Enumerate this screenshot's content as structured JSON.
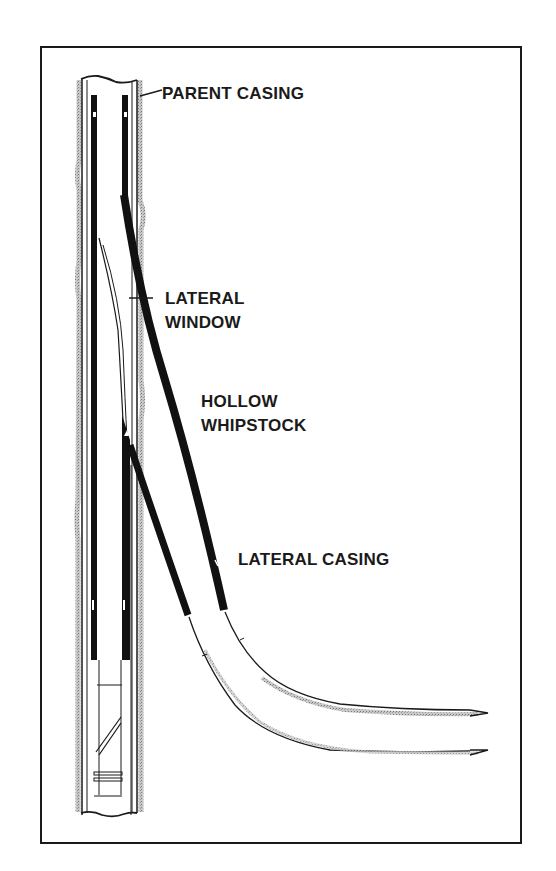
{
  "figure": {
    "type": "well-schematic",
    "description_visible": "Multilateral well diagram with hollow whipstock",
    "colors": {
      "background": "#ffffff",
      "ink": "#1a1a1a",
      "shading": "#9a9a9a"
    }
  },
  "labels": {
    "parent_casing": "PARENT CASING",
    "lateral_window": [
      "LATERAL",
      "WINDOW"
    ],
    "hollow_whipstock": [
      "HOLLOW",
      "WHIPSTOCK"
    ],
    "lateral_casing": "LATERAL CASING"
  },
  "components": [
    {
      "name": "parent-casing",
      "label": "PARENT CASING"
    },
    {
      "name": "lateral-window",
      "label": "LATERAL WINDOW"
    },
    {
      "name": "hollow-whipstock",
      "label": "HOLLOW WHIPSTOCK"
    },
    {
      "name": "lateral-casing",
      "label": "LATERAL CASING"
    }
  ]
}
